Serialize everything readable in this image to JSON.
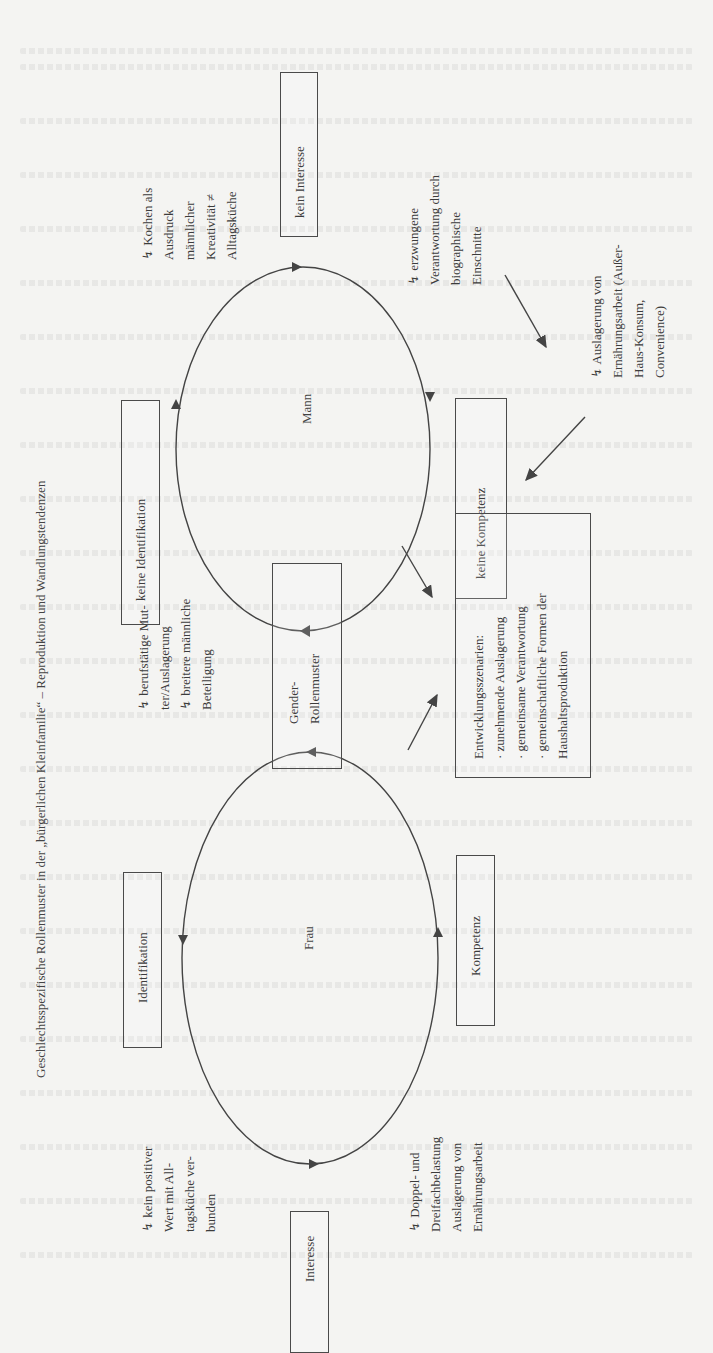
{
  "title": "Geschlechtsspezifische Rollenmuster in der „bürgerlichen Kleinfamilie“ – Reproduktion und Wandlungstendenzen",
  "ellipses": {
    "mann": {
      "label": "Mann"
    },
    "frau": {
      "label": "Frau"
    }
  },
  "boxes": {
    "kein_interesse": "kein Interesse",
    "keine_identifikation": "keine Identifikation",
    "keine_kompetenz": "keine Kompetenz",
    "gender_rollenmuster": [
      "Gender-",
      "Rollenmuster"
    ],
    "entwicklung": [
      "Entwicklungsszenarien:",
      "· zunehmende Auslagerung",
      "· gemeinsame Verantwortung",
      "· gemeinschaftliche Formen der",
      "Haushaltsproduktion"
    ],
    "identifikation": "Identifikation",
    "kompetenz": "Kompetenz",
    "interesse": "Interesse"
  },
  "annotations": {
    "kochen": [
      "↯ Kochen als",
      "Ausdruck",
      "männlicher",
      "Kreativität ≠",
      "Alltagsküche"
    ],
    "erzwungene": [
      "↯ erzwungene",
      "Verantwortung durch",
      "biographische",
      "Einschnitte"
    ],
    "auslagerung_mann": [
      "↯ Auslagerung von",
      "Ernährungsarbeit (Außer-",
      "Haus-Konsum,",
      "Convenience)"
    ],
    "berufstaetige": [
      "↯ berufstätige Mut-",
      "ter/Auslagerung",
      "↯ breitere männliche",
      "Beteiligung"
    ],
    "kein_positiver": [
      "↯ kein positiver",
      "Wert mit All-",
      "tagsküche ver-",
      "bunden"
    ],
    "doppel": [
      "↯ Doppel- und",
      "Dreifachbelastung",
      "Auslagerung von",
      "Ernährungsarbeit"
    ]
  },
  "colors": {
    "ink": "#3c3c3c",
    "paper": "#f4f4f2"
  }
}
